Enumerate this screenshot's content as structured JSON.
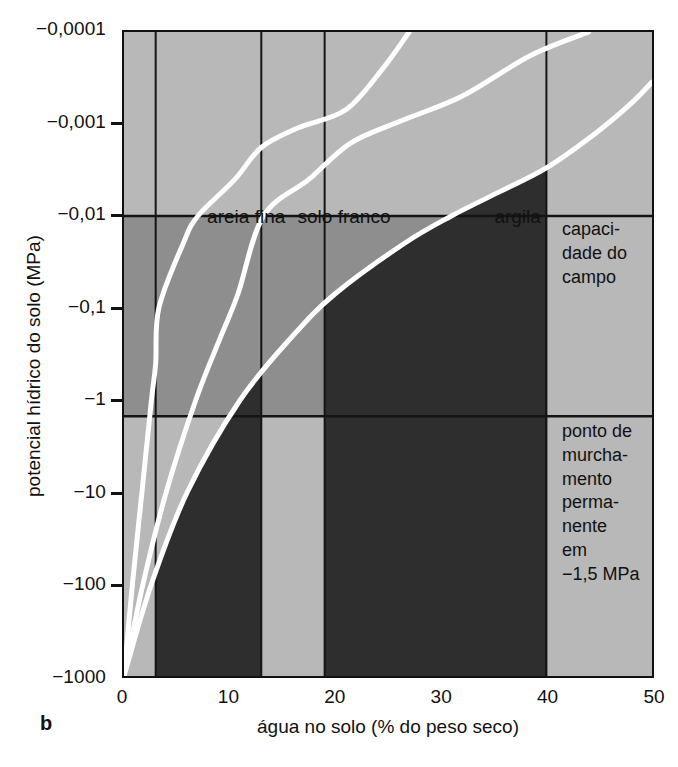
{
  "figure": {
    "panel_letter": "b",
    "xlabel": "água no solo (% do peso seco)",
    "ylabel": "potencial hídrico do solo (MPa)"
  },
  "axes": {
    "y_ticks": [
      {
        "label": "−0,0001",
        "value": -0.0001
      },
      {
        "label": "−0,001",
        "value": -0.001
      },
      {
        "label": "−0,01",
        "value": -0.01
      },
      {
        "label": "−0,1",
        "value": -0.1
      },
      {
        "label": "−1",
        "value": -1
      },
      {
        "label": "−10",
        "value": -10
      },
      {
        "label": "−100",
        "value": -100
      },
      {
        "label": "−1000",
        "value": -1000
      }
    ],
    "x_ticks": [
      {
        "label": "0",
        "value": 0
      },
      {
        "label": "10",
        "value": 10
      },
      {
        "label": "20",
        "value": 20
      },
      {
        "label": "30",
        "value": 30
      },
      {
        "label": "40",
        "value": 40
      },
      {
        "label": "50",
        "value": 50
      }
    ]
  },
  "annotations": {
    "curve_labels": [
      {
        "text": "areia fina",
        "x_pct": 8.0,
        "y_mpa": -0.013
      },
      {
        "text": "solo franco",
        "x_pct": 16.5,
        "y_mpa": -0.013
      },
      {
        "text": "argila",
        "x_pct": 35.0,
        "y_mpa": -0.013
      }
    ],
    "field_capacity": "capaci-\ndade do\ncampo",
    "wilting_point": "ponto de\nmurcha-\nmento\nperma-\nnente\nem\n−1,5 MPa"
  },
  "colors": {
    "band_light": "#b8b8b8",
    "band_mid": "#8e8e8e",
    "band_dark": "#2e2e2e",
    "curve": "#ffffff",
    "axis": "#111111",
    "background": "#ffffff"
  },
  "chart_data": {
    "type": "line",
    "title": "",
    "xlabel": "água no solo (% do peso seco)",
    "ylabel": "potencial hídrico do solo (MPa)",
    "xlim": [
      0,
      50
    ],
    "ylim_log": [
      -0.0001,
      -1000
    ],
    "y_scale": "log-negative",
    "grid": false,
    "legend": "inline-labels",
    "threshold_lines": [
      {
        "name": "capacidade do campo",
        "y_mpa": -0.01
      },
      {
        "name": "ponto de murchamento permanente",
        "y_mpa": -1.5
      }
    ],
    "soil_bands_x_pct": [
      {
        "shade": "light",
        "from": 0,
        "to": 3
      },
      {
        "shade": "dark",
        "from": 3,
        "to": 13
      },
      {
        "shade": "light",
        "from": 13,
        "to": 19
      },
      {
        "shade": "dark",
        "from": 19,
        "to": 40
      },
      {
        "shade": "light",
        "from": 40,
        "to": 50
      }
    ],
    "series": [
      {
        "name": "areia fina",
        "points": [
          {
            "x": 0.0,
            "y": -1000
          },
          {
            "x": 0.8,
            "y": -100
          },
          {
            "x": 1.7,
            "y": -10
          },
          {
            "x": 2.6,
            "y": -1
          },
          {
            "x": 3.0,
            "y": -0.4
          },
          {
            "x": 3.3,
            "y": -0.1
          },
          {
            "x": 5.6,
            "y": -0.02
          },
          {
            "x": 7.0,
            "y": -0.01
          },
          {
            "x": 10.5,
            "y": -0.004
          },
          {
            "x": 13.0,
            "y": -0.0018
          },
          {
            "x": 16.5,
            "y": -0.0011
          },
          {
            "x": 21.0,
            "y": -0.0007
          },
          {
            "x": 24.5,
            "y": -0.00025
          },
          {
            "x": 27.0,
            "y": -0.0001
          }
        ]
      },
      {
        "name": "solo franco",
        "points": [
          {
            "x": 0.0,
            "y": -1000
          },
          {
            "x": 1.8,
            "y": -100
          },
          {
            "x": 4.0,
            "y": -10
          },
          {
            "x": 6.8,
            "y": -1
          },
          {
            "x": 9.2,
            "y": -0.2
          },
          {
            "x": 10.8,
            "y": -0.07
          },
          {
            "x": 13.2,
            "y": -0.01
          },
          {
            "x": 17.5,
            "y": -0.004
          },
          {
            "x": 21.5,
            "y": -0.0016
          },
          {
            "x": 26.5,
            "y": -0.0009
          },
          {
            "x": 32.0,
            "y": -0.0005
          },
          {
            "x": 38.5,
            "y": -0.00018
          },
          {
            "x": 44.0,
            "y": -0.0001
          }
        ]
      },
      {
        "name": "argila",
        "points": [
          {
            "x": 0.0,
            "y": -1000
          },
          {
            "x": 2.6,
            "y": -100
          },
          {
            "x": 6.0,
            "y": -10
          },
          {
            "x": 11.0,
            "y": -1
          },
          {
            "x": 16.0,
            "y": -0.2
          },
          {
            "x": 20.0,
            "y": -0.07
          },
          {
            "x": 26.5,
            "y": -0.02
          },
          {
            "x": 31.0,
            "y": -0.01
          },
          {
            "x": 35.5,
            "y": -0.0055
          },
          {
            "x": 40.0,
            "y": -0.003
          },
          {
            "x": 44.5,
            "y": -0.0013
          },
          {
            "x": 48.0,
            "y": -0.0006
          },
          {
            "x": 50.0,
            "y": -0.00035
          }
        ]
      }
    ]
  }
}
